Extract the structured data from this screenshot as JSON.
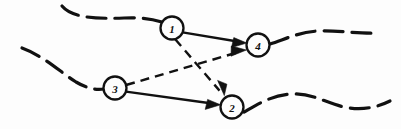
{
  "figure": {
    "background_color": "#fdfdfd",
    "ink_color": "#111111",
    "width": 401,
    "height": 129
  },
  "nodes": [
    {
      "id": "1",
      "label": "1",
      "cx": 172,
      "cy": 28,
      "r": 11.5
    },
    {
      "id": "2",
      "label": "2",
      "cx": 232,
      "cy": 107,
      "r": 11.5
    },
    {
      "id": "3",
      "label": "3",
      "cx": 115,
      "cy": 88,
      "r": 11.5
    },
    {
      "id": "4",
      "label": "4",
      "cx": 258,
      "cy": 45,
      "r": 11.5
    }
  ],
  "edges": [
    {
      "id": "e1-4",
      "from": "1",
      "to": "4",
      "style": "solid",
      "arrow": true
    },
    {
      "id": "e1-2",
      "from": "1",
      "to": "2",
      "style": "dashed",
      "arrow": true
    },
    {
      "id": "e3-4",
      "from": "3",
      "to": "4",
      "style": "dashed",
      "arrow": true
    },
    {
      "id": "e3-2",
      "from": "3",
      "to": "2",
      "style": "solid",
      "arrow": true
    }
  ],
  "boundary_curves": [
    {
      "id": "top-left-curve",
      "style": "dashed",
      "description": "upper boundary entering node 1 from the left"
    },
    {
      "id": "top-right-curve",
      "style": "dashed",
      "description": "upper boundary leaving node 4 to the right"
    },
    {
      "id": "bottom-left-curve",
      "style": "dashed",
      "description": "lower boundary entering node 3 from the upper left"
    },
    {
      "id": "bottom-right-curve",
      "style": "dashed",
      "description": "lower boundary leaving node 2 to the right"
    }
  ]
}
